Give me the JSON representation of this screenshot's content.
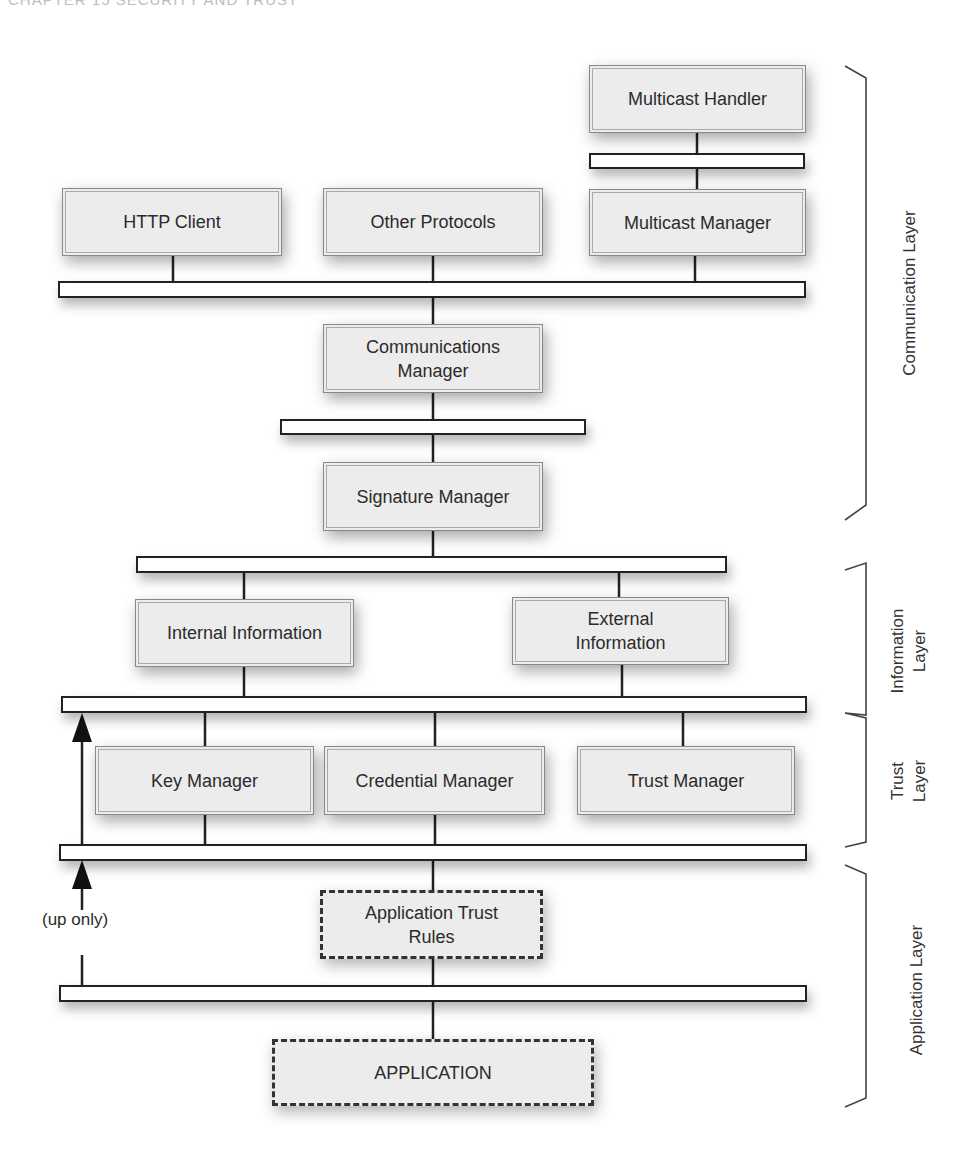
{
  "page": {
    "running_head": "CHAPTER 15  SECURITY AND TRUST"
  },
  "diagram": {
    "components": {
      "multicast_handler": "Multicast Handler",
      "http_client": "HTTP Client",
      "other_protocols": "Other Protocols",
      "multicast_manager": "Multicast Manager",
      "communications_manager_line1": "Communications",
      "communications_manager_line2": "Manager",
      "signature_manager": "Signature Manager",
      "internal_information": "Internal Information",
      "external_information_line1": "External",
      "external_information_line2": "Information",
      "key_manager": "Key Manager",
      "credential_manager": "Credential Manager",
      "trust_manager": "Trust Manager",
      "application_trust_rules_line1": "Application Trust",
      "application_trust_rules_line2": "Rules",
      "application": "APPLICATION"
    },
    "annotations": {
      "up_only": "(up only)"
    },
    "layers": {
      "communication": "Communication Layer",
      "information_line1": "Information",
      "information_line2": "Layer",
      "trust_line1": "Trust",
      "trust_line2": "Layer",
      "application": "Application Layer"
    },
    "colors": {
      "box_fill": "#ececec",
      "bus_fill": "#ffffff",
      "line": "#222222"
    }
  }
}
